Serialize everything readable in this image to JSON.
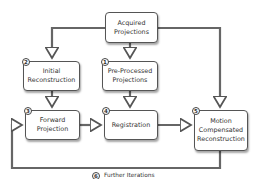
{
  "nodes": [
    {
      "id": "acquired",
      "label_line1": "Acquired",
      "label_line2": "Projections",
      "number": ""
    },
    {
      "id": "initial",
      "label_line1": "Initial",
      "label_line2": "Reconstruction",
      "number": "2"
    },
    {
      "id": "preprocessed",
      "label_line1": "Pre-Processed",
      "label_line2": "Projections",
      "number": "1"
    },
    {
      "id": "forward",
      "label_line1": "Forward",
      "label_line2": "Projection",
      "number": "3"
    },
    {
      "id": "registration",
      "label_line1": "Registration",
      "label_line2": "",
      "number": "4"
    },
    {
      "id": "motion",
      "label_line1": "Motion",
      "label_line2": "Compensated",
      "label_line3": "Reconstruction",
      "number": "5"
    }
  ],
  "loop": {
    "number": "6",
    "label": "Further Iterations"
  },
  "edges": [
    [
      "acquired",
      "initial"
    ],
    [
      "acquired",
      "preprocessed"
    ],
    [
      "acquired",
      "motion"
    ],
    [
      "initial",
      "forward"
    ],
    [
      "preprocessed",
      "registration"
    ],
    [
      "forward",
      "registration"
    ],
    [
      "registration",
      "motion"
    ],
    [
      "motion",
      "forward"
    ]
  ]
}
